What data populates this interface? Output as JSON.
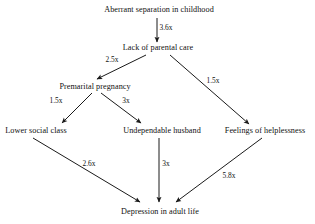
{
  "diagram": {
    "type": "flow-diagram",
    "background_color": "#ffffff",
    "line_color": "#1a1a1a",
    "text_color": "#111111",
    "nodes": [
      {
        "id": "separation",
        "label": "Aberrant separation in childhood",
        "x": 159,
        "y": 10
      },
      {
        "id": "parental",
        "label": "Lack of parental care",
        "x": 158,
        "y": 48
      },
      {
        "id": "premarital",
        "label": "Premarital pregnancy",
        "x": 95,
        "y": 87
      },
      {
        "id": "lowerclass",
        "label": "Lower social class",
        "x": 36,
        "y": 131
      },
      {
        "id": "husband",
        "label": "Undependable husband",
        "x": 162,
        "y": 131
      },
      {
        "id": "helpless",
        "label": "Feelings of helplessness",
        "x": 265,
        "y": 131
      },
      {
        "id": "depression",
        "label": "Depression in adult life",
        "x": 160,
        "y": 212
      }
    ],
    "edges": [
      {
        "id": "e1",
        "from": "separation",
        "to": "parental",
        "label": "3.6x",
        "label_x": 166,
        "label_y": 28,
        "x1": 157,
        "y1": 18,
        "x2": 157,
        "y2": 42
      },
      {
        "id": "e2",
        "from": "parental",
        "to": "premarital",
        "label": "2.5x",
        "label_x": 112,
        "label_y": 60,
        "x1": 146,
        "y1": 55,
        "x2": 97,
        "y2": 79
      },
      {
        "id": "e3",
        "from": "parental",
        "to": "helpless",
        "label": "1.5x",
        "label_x": 213,
        "label_y": 81,
        "x1": 170,
        "y1": 55,
        "x2": 249,
        "y2": 124
      },
      {
        "id": "e4",
        "from": "premarital",
        "to": "lowerclass",
        "label": "1.5x",
        "label_x": 56,
        "label_y": 101,
        "x1": 92,
        "y1": 93,
        "x2": 62,
        "y2": 123
      },
      {
        "id": "e5",
        "from": "premarital",
        "to": "husband",
        "label": "3x",
        "label_x": 126,
        "label_y": 101,
        "x1": 101,
        "y1": 93,
        "x2": 141,
        "y2": 123
      },
      {
        "id": "e6",
        "from": "lowerclass",
        "to": "depression",
        "label": "2.6x",
        "label_x": 89,
        "label_y": 164,
        "x1": 33,
        "y1": 138,
        "x2": 140,
        "y2": 202
      },
      {
        "id": "e7",
        "from": "husband",
        "to": "depression",
        "label": "3x",
        "label_x": 166,
        "label_y": 164,
        "x1": 159,
        "y1": 138,
        "x2": 159,
        "y2": 202
      },
      {
        "id": "e8",
        "from": "helpless",
        "to": "depression",
        "label": "5.8x",
        "label_x": 229,
        "label_y": 176,
        "x1": 262,
        "y1": 138,
        "x2": 176,
        "y2": 202
      }
    ]
  }
}
